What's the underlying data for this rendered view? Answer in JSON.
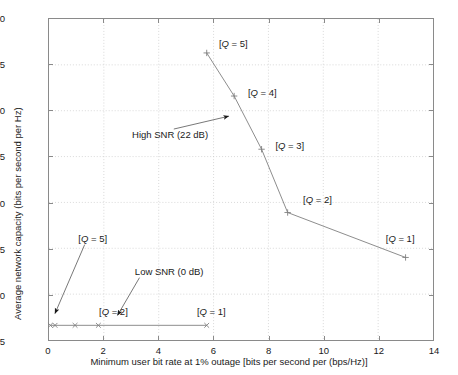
{
  "chart_data": {
    "type": "line",
    "title": "",
    "xlabel": "Minimum user bit rate at 1% outage [bits per second per (bps/Hz)]",
    "ylabel": "Average network capacity (bits per second per Hz)",
    "xlim": [
      0,
      14
    ],
    "ylim": [
      5,
      40
    ],
    "xticks": [
      0,
      2,
      4,
      6,
      8,
      10,
      12,
      14
    ],
    "yticks": [
      5,
      10,
      15,
      20,
      25,
      30,
      35,
      40
    ],
    "grid": true,
    "legend": "none",
    "series": [
      {
        "name": "High SNR (22 dB)",
        "marker": "plus",
        "color": "#808080",
        "points": [
          {
            "label": "[Q = 5]",
            "x": 5.75,
            "y": 36.3
          },
          {
            "label": "[Q = 4]",
            "x": 6.75,
            "y": 31.6
          },
          {
            "label": "[Q = 3]",
            "x": 7.75,
            "y": 25.8
          },
          {
            "label": "[Q = 2]",
            "x": 8.7,
            "y": 18.9
          },
          {
            "label": "[Q = 1]",
            "x": 13.0,
            "y": 14.0
          }
        ]
      },
      {
        "name": "Low SNR (0 dB)",
        "marker": "cross",
        "color": "#808080",
        "points": [
          {
            "label": "[Q = 5]",
            "x": 0.05,
            "y": 6.6
          },
          {
            "label": "",
            "x": 0.22,
            "y": 6.6
          },
          {
            "label": "",
            "x": 0.95,
            "y": 6.6
          },
          {
            "label": "[Q = 2]",
            "x": 1.8,
            "y": 6.6
          },
          {
            "label": "[Q = 1]",
            "x": 5.75,
            "y": 6.6
          }
        ]
      }
    ],
    "annotations": [
      {
        "name": "high-snr-annotation",
        "text": "High SNR (22 dB)",
        "x": 3.05,
        "y": 27.3
      },
      {
        "name": "low-snr-annotation",
        "text": "Low SNR (0 dB)",
        "x": 3.15,
        "y": 12.5
      },
      {
        "name": "q5-high-label",
        "text": "[Q = 5]",
        "x": 6.2,
        "y": 37.2
      },
      {
        "name": "q4-high-label",
        "text": "[Q = 4]",
        "x": 7.25,
        "y": 31.9
      },
      {
        "name": "q3-high-label",
        "text": "[Q = 3]",
        "x": 8.25,
        "y": 26.1
      },
      {
        "name": "q2-high-label",
        "text": "[Q = 2]",
        "x": 9.25,
        "y": 20.3
      },
      {
        "name": "q1-high-label",
        "text": "[Q = 1]",
        "x": 12.25,
        "y": 16.0
      },
      {
        "name": "q5-low-label",
        "text": "[Q = 5]",
        "x": 1.1,
        "y": 16.1
      },
      {
        "name": "q2-low-label",
        "text": "[Q = 2]",
        "x": 1.85,
        "y": 8.1
      },
      {
        "name": "q1-low-label",
        "text": "[Q = 1]",
        "x": 5.4,
        "y": 8.1
      }
    ],
    "arrows": [
      {
        "name": "high-snr-arrow",
        "x1": 4.55,
        "y1": 28.0,
        "x2": 6.55,
        "y2": 29.4
      },
      {
        "name": "low-snr-arrow",
        "x1": 3.3,
        "y1": 11.8,
        "x2": 2.5,
        "y2": 7.7
      },
      {
        "name": "q5-low-arrow",
        "x1": 1.3,
        "y1": 15.4,
        "x2": 0.22,
        "y2": 7.9
      }
    ]
  },
  "axis_labels": {
    "x": "Minimum user bit rate at 1% outage [bits per second per (bps/Hz)]",
    "y": "Average network capacity (bits per second per Hz)"
  }
}
